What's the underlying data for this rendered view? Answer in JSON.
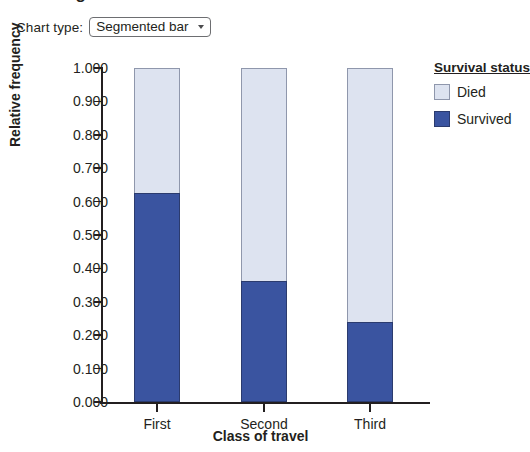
{
  "page": {
    "title_clipped": "Passenger survival"
  },
  "controls": {
    "chart_type_label": "Chart type:",
    "chart_type_value": "Segmented bar",
    "caret_icon": "chevron-down-icon"
  },
  "legend": {
    "title": "Survival status",
    "items": [
      {
        "label": "Died",
        "color": "#dde3f0"
      },
      {
        "label": "Survived",
        "color": "#3a54a0"
      }
    ]
  },
  "chart_data": {
    "type": "bar",
    "subtype": "stacked-100-percent-segmented-bar",
    "title": "",
    "xlabel": "Class of travel",
    "ylabel": "Relative frequency",
    "categories": [
      "First",
      "Second",
      "Third"
    ],
    "ylim": [
      0.0,
      1.0
    ],
    "ytick_labels": [
      "0.000",
      "0.100",
      "0.200",
      "0.300",
      "0.400",
      "0.500",
      "0.600",
      "0.700",
      "0.800",
      "0.900",
      "1.000"
    ],
    "ytick_values": [
      0.0,
      0.1,
      0.2,
      0.3,
      0.4,
      0.5,
      0.6,
      0.7,
      0.8,
      0.9,
      1.0
    ],
    "grid": false,
    "legend_position": "right",
    "series": [
      {
        "name": "Survived",
        "color": "#3a54a0",
        "values": [
          0.625,
          0.362,
          0.24
        ]
      },
      {
        "name": "Died",
        "color": "#dde3f0",
        "values": [
          0.375,
          0.638,
          0.76
        ]
      }
    ]
  }
}
